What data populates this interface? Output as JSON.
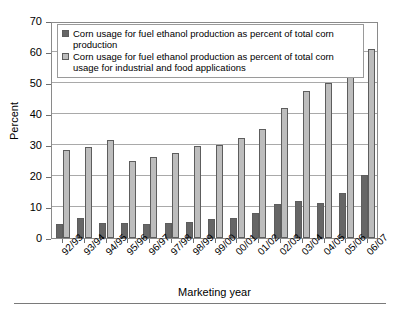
{
  "chart_data": {
    "type": "bar",
    "title": "",
    "xlabel": "Marketing year",
    "ylabel": "Percent",
    "ylim": [
      0,
      70
    ],
    "ytick_step": 10,
    "yticks": [
      0,
      10,
      20,
      30,
      40,
      50,
      60,
      70
    ],
    "grid": true,
    "legend_position": "top-inside",
    "categories": [
      "92/93",
      "93/94",
      "94/95",
      "95/96",
      "96/97",
      "97/98",
      "98/99",
      "99/00",
      "00/01",
      "01/02",
      "02/03",
      "03/04",
      "04/05",
      "05/06",
      "06/07"
    ],
    "series": [
      {
        "name": "Corn usage for fuel ethanol production as percent of total corn production",
        "color": "#666666",
        "values": [
          4.5,
          6.5,
          5.0,
          4.8,
          4.5,
          5.0,
          5.3,
          6.0,
          6.3,
          8.0,
          11.0,
          11.8,
          11.3,
          14.5,
          20.3
        ]
      },
      {
        "name": "Corn usage for fuel ethanol production as percent of total corn usage for industrial and food applications",
        "color": "#bdbdbd",
        "values": [
          28.5,
          29.5,
          31.5,
          25.0,
          26.0,
          27.3,
          29.8,
          30.0,
          32.3,
          35.3,
          42.0,
          47.5,
          50.0,
          54.0,
          61.0
        ]
      }
    ]
  },
  "axes": {
    "y_title": "Percent",
    "x_title": "Marketing year"
  },
  "legend": {
    "entries": [
      {
        "label": "Corn usage for fuel ethanol production as percent of total corn production"
      },
      {
        "label": "Corn usage for fuel ethanol production as percent of total corn usage for industrial and food applications"
      }
    ]
  },
  "colors": {
    "series_1": "#666666",
    "series_2": "#bdbdbd",
    "grid": "#a9a9a9",
    "frame": "#8a8a8a",
    "background": "#ffffff"
  }
}
